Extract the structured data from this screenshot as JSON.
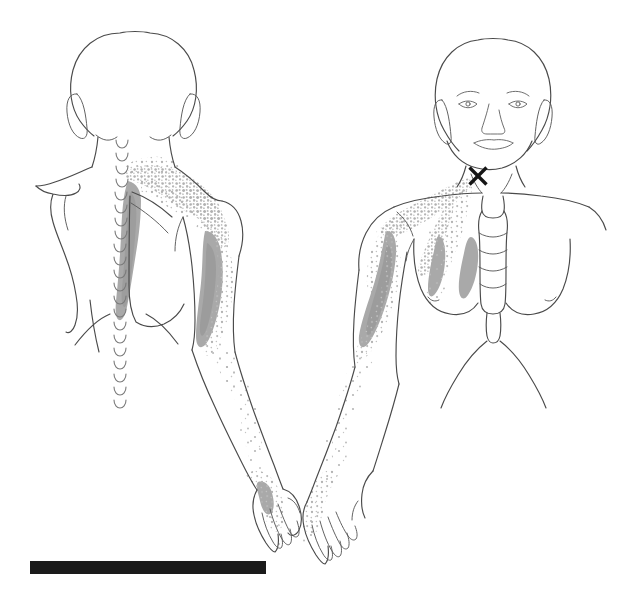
{
  "figure": {
    "title": "Referred pain pattern — upper back, shoulder and arm",
    "views": [
      {
        "id": "posterior",
        "label": "Posterior view",
        "side": "left",
        "orientation": "back"
      },
      {
        "id": "anterior",
        "label": "Anterior view",
        "side": "right",
        "orientation": "front"
      }
    ],
    "markers": [
      {
        "name": "trigger-point-x",
        "glyph": "X",
        "view": "anterior",
        "location_label": "supraclavicular / anterior scrotal neck base",
        "x": 478,
        "y": 176,
        "color": "#151515"
      }
    ],
    "legend": {
      "solid_zone_label": "Essential (solid) referred pain zone",
      "stipple_zone_label": "Spillover (stippled) referred pain zone",
      "marker_label": "X = trigger point",
      "solid_color": "#a9a9a9",
      "stipple_color": "#b4b4b4",
      "outline_color": "#4a4a4a"
    },
    "scale_bar": {
      "name": "scale-bar",
      "x": 30,
      "y": 561,
      "width": 236,
      "height": 13,
      "color": "#1b1b1b",
      "label": ""
    },
    "spine": {
      "name": "spinous-process-column",
      "vertebra_count": 22,
      "glyph": "u-shaped-mark"
    }
  },
  "pain_zones": [
    {
      "view": "posterior",
      "region": "medial-scapular-border",
      "type": "solid",
      "intensity": "essential"
    },
    {
      "view": "posterior",
      "region": "suprascapular-upper-trapezius",
      "type": "stipple",
      "intensity": "spillover"
    },
    {
      "view": "posterior",
      "region": "posterior-deltoid-lateral-upper-arm",
      "type": "solid",
      "intensity": "essential"
    },
    {
      "view": "posterior",
      "region": "dorsal-forearm",
      "type": "stipple",
      "intensity": "spillover"
    },
    {
      "view": "posterior",
      "region": "dorsum-of-hand",
      "type": "stipple",
      "intensity": "spillover"
    },
    {
      "view": "anterior",
      "region": "infraclavicular-upper-chest",
      "type": "stipple",
      "intensity": "spillover"
    },
    {
      "view": "anterior",
      "region": "pectoral-parasternal",
      "type": "solid",
      "intensity": "essential"
    },
    {
      "view": "anterior",
      "region": "anterior-deltoid-lateral-arm",
      "type": "solid",
      "intensity": "essential"
    },
    {
      "view": "anterior",
      "region": "volar-forearm",
      "type": "stipple",
      "intensity": "spillover"
    },
    {
      "view": "anterior",
      "region": "palm-thenar",
      "type": "stipple",
      "intensity": "spillover"
    }
  ]
}
